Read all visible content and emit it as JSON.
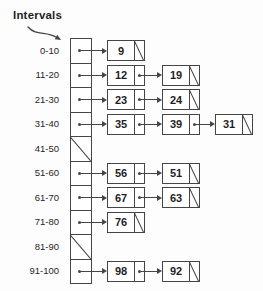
{
  "title": "Intervals",
  "colors": {
    "line": "#454545",
    "text": "#1f1f1f",
    "background": "#fdfdfd"
  },
  "buckets": [
    {
      "label": "0-10",
      "chain": [
        9
      ]
    },
    {
      "label": "11-20",
      "chain": [
        12,
        19
      ]
    },
    {
      "label": "21-30",
      "chain": [
        23,
        24
      ]
    },
    {
      "label": "31-40",
      "chain": [
        35,
        39,
        31
      ]
    },
    {
      "label": "41-50",
      "chain": []
    },
    {
      "label": "51-60",
      "chain": [
        56,
        51
      ]
    },
    {
      "label": "61-70",
      "chain": [
        67,
        63
      ]
    },
    {
      "label": "71-80",
      "chain": [
        76
      ]
    },
    {
      "label": "81-90",
      "chain": []
    },
    {
      "label": "91-100",
      "chain": [
        98,
        92
      ]
    }
  ]
}
